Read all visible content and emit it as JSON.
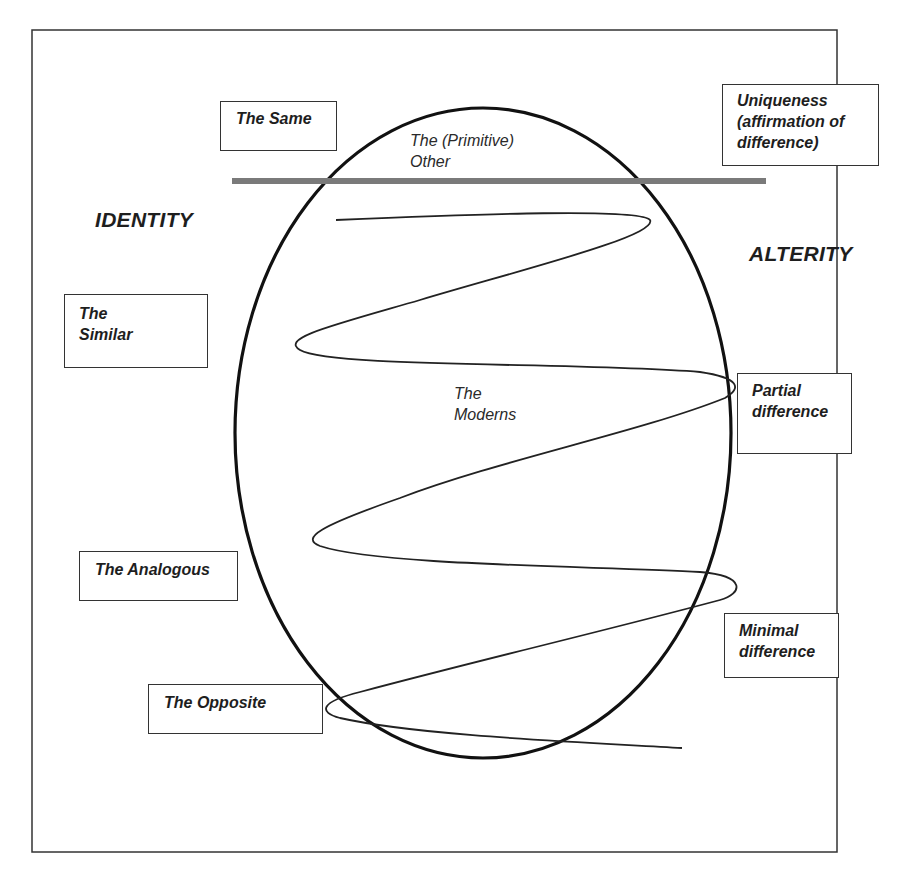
{
  "diagram": {
    "axis_labels": {
      "left": "IDENTITY",
      "right": "ALTERITY"
    },
    "ellipse_labels": {
      "top": "The (Primitive)\nOther",
      "top_line1": "The (Primitive)",
      "top_line2": "Other",
      "center_line1": "The",
      "center_line2": "Moderns"
    },
    "identity_boxes": [
      {
        "id": "same",
        "line1": "The Same",
        "line2": ""
      },
      {
        "id": "similar",
        "line1": "The",
        "line2": "Similar"
      },
      {
        "id": "analogous",
        "line1": "The Analogous",
        "line2": ""
      },
      {
        "id": "opposite",
        "line1": "The Opposite",
        "line2": ""
      }
    ],
    "alterity_boxes": [
      {
        "id": "uniqueness",
        "line1": "Uniqueness",
        "line2": "(affirmation of",
        "line3": "difference)"
      },
      {
        "id": "partial",
        "line1": "Partial",
        "line2": "difference"
      },
      {
        "id": "minimal",
        "line1": "Minimal",
        "line2": "difference"
      }
    ],
    "colors": {
      "frame": "#333333",
      "ellipse": "#111111",
      "spiral": "#222222",
      "divider_bar": "#7a7a7a",
      "text": "#1e1e1e"
    }
  }
}
